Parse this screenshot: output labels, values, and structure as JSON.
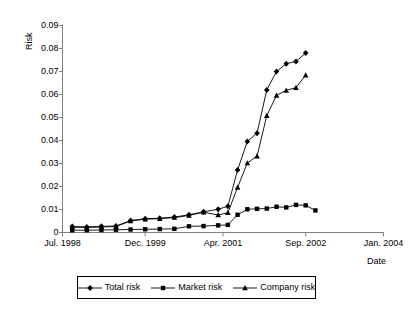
{
  "chart_data": {
    "type": "line",
    "title": "",
    "xlabel": "Date",
    "ylabel": "Risk",
    "ylim": [
      0,
      0.09
    ],
    "ytick_labels": [
      "0.09",
      "0.08",
      "0.07",
      "0.06",
      "0.05",
      "0.04",
      "0.03",
      "0.02",
      "0.01",
      "0"
    ],
    "ytick_values": [
      0.09,
      0.08,
      0.07,
      0.06,
      0.05,
      0.04,
      0.03,
      0.02,
      0.01,
      0
    ],
    "xtick_labels": [
      "Jul. 1998",
      "Dec. 1999",
      "Apr. 2001",
      "Sep. 2002",
      "Jan. 2004"
    ],
    "xtick_values": [
      0,
      17,
      33,
      50,
      66
    ],
    "xlim": [
      0,
      66
    ],
    "grid": false,
    "legend_position": "bottom",
    "x": [
      2,
      5,
      8,
      11,
      14,
      17,
      20,
      23,
      26,
      29,
      32,
      34,
      36,
      38,
      40,
      42,
      44,
      46,
      48,
      50,
      52,
      54,
      56,
      58
    ],
    "series": [
      {
        "name": "Total risk",
        "marker": "diamond",
        "values": [
          0.0026,
          0.0024,
          0.0027,
          0.0028,
          0.0052,
          0.006,
          0.0062,
          0.0067,
          0.0077,
          0.009,
          0.0101,
          0.0114,
          0.0272,
          0.0396,
          0.0432,
          0.062,
          0.07,
          0.0734,
          0.0744,
          0.078,
          null,
          null,
          null,
          null
        ]
      },
      {
        "name": "Market risk",
        "marker": "square",
        "values": [
          0.001,
          0.001,
          0.0011,
          0.0012,
          0.0013,
          0.0014,
          0.0015,
          0.0016,
          0.0027,
          0.0028,
          0.0031,
          0.0033,
          0.0077,
          0.0101,
          0.0103,
          0.0104,
          0.0112,
          0.0109,
          0.012,
          0.0118,
          0.0096,
          null,
          null,
          null
        ]
      },
      {
        "name": "Company risk",
        "marker": "triangle",
        "values": [
          0.0023,
          0.0022,
          0.0024,
          0.0026,
          0.005,
          0.0058,
          0.006,
          0.0065,
          0.0074,
          0.0088,
          0.0076,
          0.0086,
          0.0196,
          0.0302,
          0.0332,
          0.0508,
          0.0596,
          0.0618,
          0.063,
          0.0684,
          null,
          null,
          null,
          null
        ]
      }
    ]
  },
  "legend": {
    "items": [
      {
        "label": "Total risk",
        "marker": "diamond"
      },
      {
        "label": "Market risk",
        "marker": "square"
      },
      {
        "label": "Company risk",
        "marker": "triangle"
      }
    ]
  },
  "colors": {
    "line": "#000000",
    "axis": "#808080",
    "background": "#ffffff"
  }
}
